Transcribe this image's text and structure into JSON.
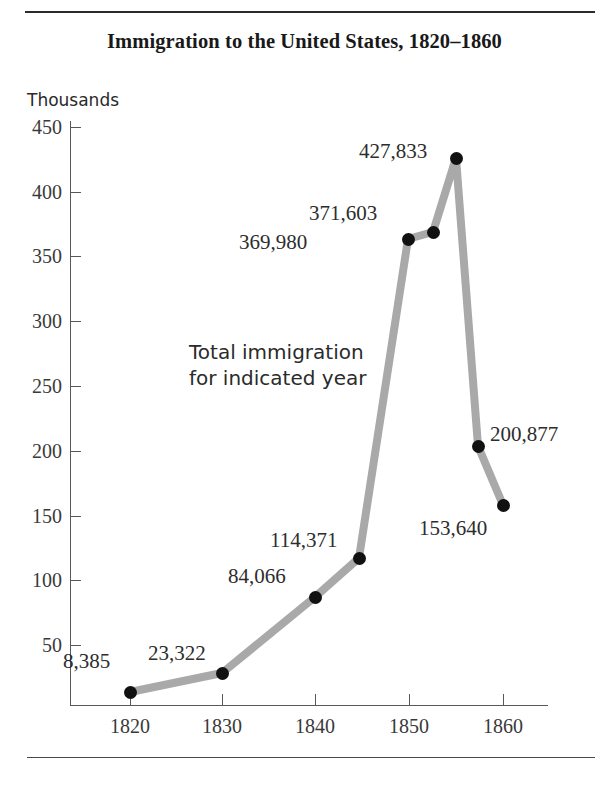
{
  "figure": {
    "title": "Immigration to the United States, 1820–1860",
    "axis_unit_caption": "Thousands",
    "annotation": "Total immigration\nfor indicated year",
    "line_color": "#a9a9a9",
    "marker_color": "#111111",
    "axis_color": "#58585a",
    "rule_color": "#2b2b2b"
  },
  "chart_data": {
    "type": "line",
    "title": "Immigration to the United States, 1820–1860",
    "subtitle": "",
    "xlabel": "",
    "ylabel": "Thousands",
    "xlim": [
      1816,
      1868
    ],
    "ylim": [
      0,
      460
    ],
    "grid": false,
    "legend": "none",
    "annotations": [
      "Total immigration for indicated year"
    ],
    "x_ticks": [
      "1820",
      "1830",
      "1840",
      "1850",
      "1860"
    ],
    "y_ticks": [
      "50",
      "100",
      "150",
      "200",
      "250",
      "300",
      "350",
      "400",
      "450"
    ],
    "x": [
      1820,
      1830,
      1840,
      1845,
      1850,
      1852,
      1854,
      1857,
      1860
    ],
    "values": [
      8.385,
      23.322,
      84.066,
      114.371,
      369.98,
      371.603,
      427.833,
      200.877,
      153.64
    ],
    "point_labels": [
      "8,385",
      "23,322",
      "84,066",
      "114,371",
      "369,980",
      "371,603",
      "427,833",
      "200,877",
      "153,640"
    ],
    "series": [
      {
        "name": "Total immigration",
        "values": [
          8.385,
          23.322,
          84.066,
          114.371,
          369.98,
          371.603,
          427.833,
          200.877,
          153.64
        ]
      }
    ]
  },
  "y_axis": {
    "ticks": [
      {
        "label": "450",
        "y": 127
      },
      {
        "label": "400",
        "y": 192
      },
      {
        "label": "350",
        "y": 256
      },
      {
        "label": "300",
        "y": 321
      },
      {
        "label": "250",
        "y": 386
      },
      {
        "label": "200",
        "y": 451
      },
      {
        "label": "150",
        "y": 516
      },
      {
        "label": "100",
        "y": 580
      },
      {
        "label": "50",
        "y": 645
      }
    ]
  },
  "x_axis": {
    "ticks": [
      {
        "label": "1820",
        "x": 130
      },
      {
        "label": "1830",
        "x": 222
      },
      {
        "label": "1840",
        "x": 315
      },
      {
        "label": "1850",
        "x": 409
      },
      {
        "label": "1860",
        "x": 503
      }
    ]
  },
  "points": [
    {
      "label": "8,385",
      "x": 130,
      "y": 692,
      "lx": 63,
      "ly": 651
    },
    {
      "label": "23,322",
      "x": 222,
      "y": 673,
      "lx": 148,
      "ly": 643
    },
    {
      "label": "84,066",
      "x": 315,
      "y": 597,
      "lx": 228,
      "ly": 566
    },
    {
      "label": "114,371",
      "x": 359,
      "y": 558,
      "lx": 270,
      "ly": 530
    },
    {
      "label": "369,980",
      "x": 408,
      "y": 239,
      "lx": 239,
      "ly": 232
    },
    {
      "label": "371,603",
      "x": 433,
      "y": 232,
      "lx": 309,
      "ly": 203
    },
    {
      "label": "427,833",
      "x": 456,
      "y": 158,
      "lx": 359,
      "ly": 141
    },
    {
      "label": "200,877",
      "x": 478,
      "y": 446,
      "lx": 490,
      "ly": 424
    },
    {
      "label": "153,640",
      "x": 503,
      "y": 505,
      "lx": 419,
      "ly": 518
    }
  ]
}
